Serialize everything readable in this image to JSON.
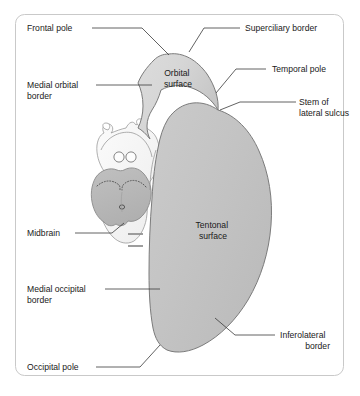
{
  "figure": {
    "frame_color": "#c9c9c9",
    "background_color": "#ffffff"
  },
  "colors": {
    "orbital_surface_fill": "#d4d4d4",
    "tentorial_surface_fill": "#c2c2c2",
    "midbrain_fill": "#b9b9b9",
    "brainstem_pale_fill": "#f2f2f2",
    "outline": "#6f6f6f",
    "leader_line": "#3a3a3a",
    "text": "#1a1a1a"
  },
  "region_labels": [
    {
      "id": "orbital-surface",
      "line1": "Orbital",
      "line2": "surface",
      "x": 178,
      "y": 76
    },
    {
      "id": "tentonal-surface",
      "line1": "Tentonal",
      "line2": "surface",
      "x": 213,
      "y": 228
    }
  ],
  "callouts": [
    {
      "id": "frontal-pole",
      "text": "Frontal pole",
      "text_x": 27,
      "text_y": 31,
      "anchor": "start",
      "lines": [
        "M 92 28 L 142 28 L 169 55"
      ]
    },
    {
      "id": "superciliary-border",
      "text": "Superciliary border",
      "text_x": 245,
      "text_y": 31,
      "anchor": "start",
      "lines": [
        "M 240 28 L 204 28 L 189 52"
      ]
    },
    {
      "id": "medial-orbital-border",
      "text_lines": [
        "Medial orbital",
        "border"
      ],
      "text_x": 27,
      "text_y": 88,
      "anchor": "start",
      "lines": [
        "M 96 85 L 152 85"
      ]
    },
    {
      "id": "temporal-pole",
      "text": "Temporal pole",
      "text_x": 272,
      "text_y": 72,
      "anchor": "start",
      "lines": [
        "M 266 69 L 236 69 L 216 93"
      ]
    },
    {
      "id": "stem-of-lateral-sulcus",
      "text_lines": [
        "Stem of",
        "lateral sulcus"
      ],
      "text_x": 299,
      "text_y": 105,
      "anchor": "start",
      "lines": [
        "M 296 102 L 240 102 L 220 110"
      ]
    },
    {
      "id": "midbrain",
      "text": "Midbrain",
      "text_x": 27,
      "text_y": 236,
      "anchor": "start",
      "lines": [
        "M 75 233 L 112 233 L 124 223"
      ]
    },
    {
      "id": "medial-occipital-border",
      "text_lines": [
        "Medial occipital",
        "border"
      ],
      "text_x": 27,
      "text_y": 292,
      "anchor": "start",
      "lines": [
        "M 105 289 L 160 289"
      ]
    },
    {
      "id": "inferolateral-border",
      "text_lines": [
        "Inferolateral",
        "border"
      ],
      "text_x": 280,
      "text_y": 338,
      "anchor": "start",
      "lines": [
        "M 275 335 L 235 335 L 215 318"
      ]
    },
    {
      "id": "occipital-pole",
      "text": "Occipital pole",
      "text_x": 27,
      "text_y": 370,
      "anchor": "start",
      "lines": [
        "M 96 367 L 140 367 L 160 345"
      ]
    }
  ],
  "anatomy_parts": [
    {
      "id": "orbital-surface-shape",
      "name": "orbital surface of frontal lobe"
    },
    {
      "id": "tentorial-surface-shape",
      "name": "tentorial surface of temporal and occipital lobes"
    },
    {
      "id": "midbrain-shape",
      "name": "midbrain with cerebral peduncles"
    },
    {
      "id": "mammillary-bodies",
      "name": "mammillary bodies"
    },
    {
      "id": "optic-structures",
      "name": "optic chiasm and hypothalamic region"
    },
    {
      "id": "pons-marks",
      "name": "pontine section marks"
    }
  ]
}
